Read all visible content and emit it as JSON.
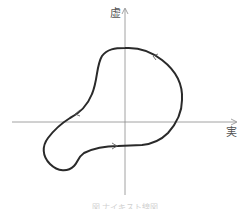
{
  "diagram": {
    "type": "nyquist-plot",
    "axes": {
      "x_label": "実",
      "y_label": "虚",
      "axis_color": "#888888",
      "origin": [
        125,
        122
      ]
    },
    "curve": {
      "description": "closed contour encircling origin, counter-clockwise",
      "stroke_color": "#2a2a2a",
      "direction_arrows": 3
    },
    "caption": "図 ナイキスト線図"
  }
}
